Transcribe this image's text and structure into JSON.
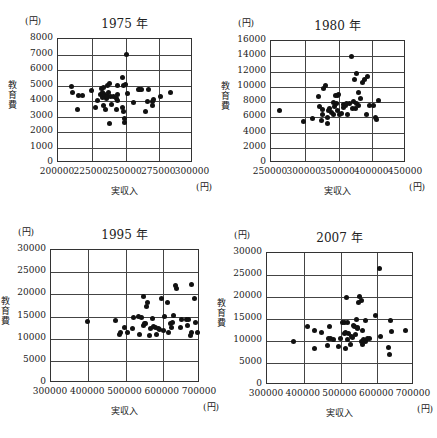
{
  "caption": "",
  "chart_data": [
    {
      "type": "scatter",
      "title": "1975 年",
      "xlabel": "実収入",
      "ylabel": "教育費",
      "x_unit": "(円)",
      "y_unit": "(円)",
      "xlim": [
        200000,
        300000
      ],
      "ylim": [
        0,
        8000
      ],
      "xticks": [
        200000,
        225000,
        250000,
        275000,
        300000
      ],
      "yticks": [
        0,
        1000,
        2000,
        3000,
        4000,
        5000,
        6000,
        7000,
        8000
      ],
      "grid": true,
      "frame": {
        "left": 57,
        "top": 38,
        "width": 135,
        "height": 124
      },
      "points": [
        [
          209900,
          4920
        ],
        [
          210400,
          4580
        ],
        [
          214300,
          3460
        ],
        [
          215300,
          4340
        ],
        [
          217800,
          4340
        ],
        [
          224600,
          4700
        ],
        [
          227800,
          3590
        ],
        [
          229000,
          4040
        ],
        [
          231600,
          4400
        ],
        [
          232300,
          4800
        ],
        [
          232800,
          4580
        ],
        [
          233000,
          4230
        ],
        [
          233500,
          3700
        ],
        [
          234000,
          4880
        ],
        [
          234300,
          4450
        ],
        [
          235000,
          3460
        ],
        [
          235600,
          4150
        ],
        [
          236000,
          4320
        ],
        [
          236300,
          5000
        ],
        [
          237000,
          4260
        ],
        [
          237500,
          4580
        ],
        [
          238000,
          5160
        ],
        [
          238200,
          2580
        ],
        [
          239000,
          4300
        ],
        [
          239800,
          3790
        ],
        [
          240800,
          4320
        ],
        [
          243200,
          4180
        ],
        [
          243500,
          3420
        ],
        [
          243800,
          5000
        ],
        [
          244000,
          4400
        ],
        [
          244300,
          4040
        ],
        [
          247500,
          5530
        ],
        [
          248000,
          3590
        ],
        [
          248200,
          3310
        ],
        [
          248400,
          5000
        ],
        [
          249000,
          2840
        ],
        [
          249400,
          2640
        ],
        [
          250000,
          5070
        ],
        [
          251000,
          7000
        ],
        [
          251400,
          4510
        ],
        [
          256000,
          3880
        ],
        [
          259300,
          4770
        ],
        [
          260200,
          4770
        ],
        [
          261500,
          4770
        ],
        [
          264600,
          3310
        ],
        [
          266400,
          4000
        ],
        [
          266900,
          4770
        ],
        [
          269900,
          4000
        ],
        [
          270200,
          3720
        ],
        [
          276200,
          4320
        ],
        [
          283700,
          4580
        ],
        [
          270600,
          4100
        ]
      ]
    },
    {
      "type": "scatter",
      "title": "1980 年",
      "xlabel": "実収入",
      "ylabel": "教育費",
      "x_unit": "(円)",
      "y_unit": "(円)",
      "xlim": [
        250000,
        450000
      ],
      "ylim": [
        0,
        16000
      ],
      "xticks": [
        250000,
        300000,
        350000,
        400000,
        450000
      ],
      "yticks": [
        0,
        2000,
        4000,
        6000,
        8000,
        10000,
        12000,
        14000,
        16000
      ],
      "grid": true,
      "frame": {
        "left": 270,
        "top": 40,
        "width": 135,
        "height": 122
      },
      "points": [
        [
          262000,
          6900
        ],
        [
          298000,
          5500
        ],
        [
          311000,
          5800
        ],
        [
          321000,
          8700
        ],
        [
          322000,
          7400
        ],
        [
          325000,
          5600
        ],
        [
          326000,
          7000
        ],
        [
          327000,
          6400
        ],
        [
          328000,
          9800
        ],
        [
          330000,
          10200
        ],
        [
          333000,
          5200
        ],
        [
          333000,
          6000
        ],
        [
          335000,
          6900
        ],
        [
          336000,
          7100
        ],
        [
          340000,
          6600
        ],
        [
          342000,
          6300
        ],
        [
          343000,
          8000
        ],
        [
          344000,
          7400
        ],
        [
          345000,
          8800
        ],
        [
          347000,
          7800
        ],
        [
          348000,
          6900
        ],
        [
          349000,
          8800
        ],
        [
          350000,
          9000
        ],
        [
          352000,
          6300
        ],
        [
          354000,
          6500
        ],
        [
          357000,
          7700
        ],
        [
          358000,
          7300
        ],
        [
          360000,
          7500
        ],
        [
          362000,
          7800
        ],
        [
          364000,
          6300
        ],
        [
          366000,
          7800
        ],
        [
          369000,
          14000
        ],
        [
          371000,
          7200
        ],
        [
          372000,
          8100
        ],
        [
          373000,
          11000
        ],
        [
          375000,
          7200
        ],
        [
          376000,
          11700
        ],
        [
          377000,
          7800
        ],
        [
          379000,
          9200
        ],
        [
          380000,
          7600
        ],
        [
          383000,
          8500
        ],
        [
          386000,
          10600
        ],
        [
          389000,
          10900
        ],
        [
          392000,
          6300
        ],
        [
          393000,
          11300
        ],
        [
          396000,
          7600
        ],
        [
          405000,
          6000
        ],
        [
          407000,
          5700
        ],
        [
          409000,
          8200
        ],
        [
          402000,
          7600
        ]
      ]
    },
    {
      "type": "scatter",
      "title": "1995 年",
      "xlabel": "実収入",
      "ylabel": "教育費",
      "x_unit": "(円)",
      "y_unit": "(円)",
      "xlim": [
        300000,
        700000
      ],
      "ylim": [
        0,
        30000
      ],
      "xticks": [
        300000,
        400000,
        500000,
        600000,
        700000
      ],
      "yticks": [
        0,
        5000,
        10000,
        15000,
        20000,
        25000,
        30000
      ],
      "grid": true,
      "frame": {
        "left": 50,
        "top": 249,
        "width": 149,
        "height": 133
      },
      "points": [
        [
          399000,
          13900
        ],
        [
          474000,
          14000
        ],
        [
          483000,
          10900
        ],
        [
          486000,
          11400
        ],
        [
          496000,
          12500
        ],
        [
          505000,
          11500
        ],
        [
          519000,
          12400
        ],
        [
          522000,
          14700
        ],
        [
          535000,
          15000
        ],
        [
          538000,
          11000
        ],
        [
          542000,
          14800
        ],
        [
          547000,
          19500
        ],
        [
          548000,
          13000
        ],
        [
          551000,
          13500
        ],
        [
          555000,
          13500
        ],
        [
          556000,
          17300
        ],
        [
          560000,
          18200
        ],
        [
          564000,
          10800
        ],
        [
          567000,
          12200
        ],
        [
          572000,
          14600
        ],
        [
          576000,
          12700
        ],
        [
          581000,
          12500
        ],
        [
          584000,
          11000
        ],
        [
          588000,
          12200
        ],
        [
          592000,
          12100
        ],
        [
          596000,
          19100
        ],
        [
          601000,
          11800
        ],
        [
          604000,
          15000
        ],
        [
          612000,
          18100
        ],
        [
          616000,
          11300
        ],
        [
          620000,
          13400
        ],
        [
          623000,
          12600
        ],
        [
          630000,
          15300
        ],
        [
          633000,
          21900
        ],
        [
          636000,
          21300
        ],
        [
          648000,
          12600
        ],
        [
          650000,
          14300
        ],
        [
          665000,
          14400
        ],
        [
          666000,
          12900
        ],
        [
          674000,
          10700
        ],
        [
          676000,
          11400
        ],
        [
          678000,
          22200
        ],
        [
          686000,
          19000
        ],
        [
          688000,
          13600
        ],
        [
          694000,
          11400
        ],
        [
          668000,
          14400
        ],
        [
          627000,
          13600
        ]
      ]
    },
    {
      "type": "scatter",
      "title": "2007 年",
      "xlabel": "実収入",
      "ylabel": "教育費",
      "x_unit": "(円)",
      "y_unit": "(円)",
      "xlim": [
        300000,
        700000
      ],
      "ylim": [
        0,
        30000
      ],
      "xticks": [
        300000,
        400000,
        500000,
        600000,
        700000
      ],
      "yticks": [
        0,
        5000,
        10000,
        15000,
        20000,
        25000,
        30000
      ],
      "grid": true,
      "frame": {
        "left": 266,
        "top": 252,
        "width": 147,
        "height": 132
      },
      "points": [
        [
          372000,
          9900
        ],
        [
          409000,
          13300
        ],
        [
          429000,
          12300
        ],
        [
          429000,
          8400
        ],
        [
          449000,
          12000
        ],
        [
          464000,
          8900
        ],
        [
          467000,
          10600
        ],
        [
          470000,
          13300
        ],
        [
          473000,
          10500
        ],
        [
          482000,
          10400
        ],
        [
          495000,
          8800
        ],
        [
          500000,
          10600
        ],
        [
          505000,
          14200
        ],
        [
          510000,
          11800
        ],
        [
          512000,
          14200
        ],
        [
          514000,
          12000
        ],
        [
          514000,
          8400
        ],
        [
          516000,
          19800
        ],
        [
          518000,
          10300
        ],
        [
          520000,
          14100
        ],
        [
          523000,
          11600
        ],
        [
          529000,
          11000
        ],
        [
          534000,
          10700
        ],
        [
          536000,
          13500
        ],
        [
          539000,
          13200
        ],
        [
          541000,
          11500
        ],
        [
          543000,
          15000
        ],
        [
          545000,
          13000
        ],
        [
          547000,
          12800
        ],
        [
          549000,
          18700
        ],
        [
          552000,
          20200
        ],
        [
          556000,
          19200
        ],
        [
          557000,
          10000
        ],
        [
          560000,
          9200
        ],
        [
          563000,
          10300
        ],
        [
          567000,
          10000
        ],
        [
          569000,
          14600
        ],
        [
          574000,
          10500
        ],
        [
          579000,
          10600
        ],
        [
          595000,
          15700
        ],
        [
          606000,
          26500
        ],
        [
          608000,
          11000
        ],
        [
          631000,
          8600
        ],
        [
          633000,
          7000
        ],
        [
          637000,
          14600
        ],
        [
          639000,
          12200
        ],
        [
          678000,
          12500
        ],
        [
          526000,
          9300
        ],
        [
          559000,
          12500
        ]
      ]
    }
  ]
}
